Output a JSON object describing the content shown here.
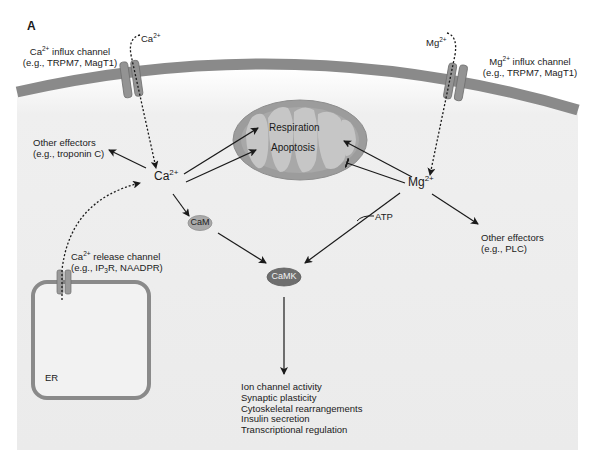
{
  "figure": {
    "panel_label": "A",
    "colors": {
      "cell_bg": "#ececec",
      "membrane": "#8a8a8a",
      "channel": "#909090",
      "mito_outer": "#9a9a9a",
      "mito_inner": "#c4c4c4",
      "cam_fill": "#a9a9a9",
      "camk_fill": "#6e6e6e",
      "arrow": "#1a1a1a"
    }
  },
  "labels": {
    "ca_influx_channel": {
      "line1_prefix": "Ca",
      "line1_sup": "2+",
      "line1_suffix": " influx channel",
      "line2": "(e.g., TRPM7, MagT1)"
    },
    "mg_influx_channel": {
      "line1_prefix": "Mg",
      "line1_sup": "2+",
      "line1_suffix": " influx channel",
      "line2": "(e.g., TRPM7, MagT1)"
    },
    "ca_extracellular": {
      "base": "Ca",
      "sup": "2+"
    },
    "mg_extracellular": {
      "base": "Mg",
      "sup": "2+"
    },
    "ca_cytosolic": {
      "base": "Ca",
      "sup": "2+"
    },
    "mg_cytosolic": {
      "base": "Mg",
      "sup": "2+"
    },
    "other_effectors_ca": {
      "line1": "Other effectors",
      "line2": "(e.g., troponin C)"
    },
    "other_effectors_mg": {
      "line1": "Other effectors",
      "line2": "(e.g., PLC)"
    },
    "ca_release_channel": {
      "line1_prefix": "Ca",
      "line1_sup": "2+",
      "line1_suffix": " release channel",
      "line2_prefix": "(e.g., IP",
      "line2_sub": "3",
      "line2_suffix": "R, NAADPR)"
    },
    "er": "ER",
    "mitochondrion": {
      "respiration": "Respiration",
      "apoptosis": "Apoptosis"
    },
    "cam": "CaM",
    "camk": "CaMK",
    "atp": "ATP"
  },
  "outcomes": [
    "Ion channel activity",
    "Synaptic plasticity",
    "Cytoskeletal rearrangements",
    "Insulin secretion",
    "Transcriptional regulation"
  ]
}
